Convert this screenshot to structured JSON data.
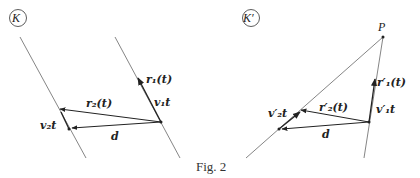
{
  "figure": {
    "caption": "Fig. 2",
    "panel_left": {
      "frame_label": "K",
      "labels": {
        "r1": "r₁(t)",
        "v1t": "v₁t",
        "r2": "r₂(t)",
        "v2t": "v₂t",
        "d": "d"
      }
    },
    "panel_right": {
      "frame_label": "K′",
      "point_label": "P",
      "labels": {
        "r1": "r′₁(t)",
        "v1t": "v′₁t",
        "r2": "r′₂(t)",
        "v2t": "v′₂t",
        "d": "d"
      }
    },
    "colors": {
      "line": "#777777",
      "vector": "#222222"
    }
  }
}
